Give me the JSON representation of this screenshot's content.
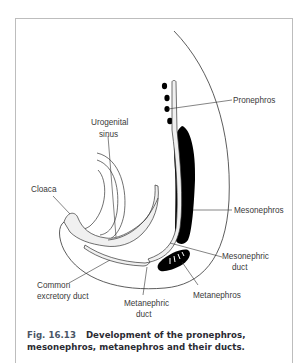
{
  "figure": {
    "number": "Fig. 16.13",
    "title_line1": "Development of the pronephros,",
    "title_line2": "mesonephros, metanephros and their ducts."
  },
  "labels": {
    "pronephros": "Pronephros",
    "urogenital_sinus_1": "Urogenital",
    "urogenital_sinus_2": "sinus",
    "cloaca": "Cloaca",
    "mesonephros": "Mesonephros",
    "mesonephric_duct_1": "Mesonephric",
    "mesonephric_duct_2": "duct",
    "common_excretory_duct_1": "Common",
    "common_excretory_duct_2": "excretory duct",
    "metanephric_duct_1": "Metanephric",
    "metanephric_duct_2": "duct",
    "metanephros": "Metanephros"
  },
  "colors": {
    "organ_fill": "#000000",
    "duct_fill": "#f0f0f0",
    "line": "#333333",
    "frame": "#bdbdbd"
  }
}
